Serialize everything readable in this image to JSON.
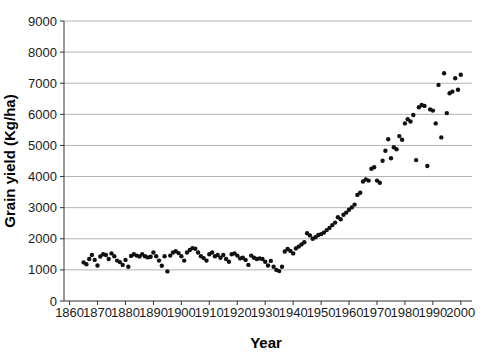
{
  "page": {
    "background": "#ffffff"
  },
  "chart_data": {
    "type": "scatter",
    "title": "",
    "xlabel": "Year",
    "ylabel": "Grain yield (Kg/ha)",
    "xlim": [
      1858,
      2004
    ],
    "ylim": [
      0,
      9000
    ],
    "xticks": [
      1860,
      1870,
      1880,
      1890,
      1900,
      1910,
      1920,
      1930,
      1940,
      1950,
      1960,
      1970,
      1980,
      1990,
      2000
    ],
    "yticks": [
      0,
      1000,
      2000,
      3000,
      4000,
      5000,
      6000,
      7000,
      8000,
      9000
    ],
    "grid": "horizontal",
    "legend": "none",
    "gridline_color": "#b3b3b3",
    "axis_color": "#333333",
    "marker": {
      "shape": "circle",
      "color": "#111111",
      "diameter_px": 4.4
    },
    "series": [
      {
        "name": "Grain yield",
        "points": [
          [
            1865,
            1240
          ],
          [
            1866,
            1180
          ],
          [
            1867,
            1350
          ],
          [
            1868,
            1480
          ],
          [
            1869,
            1320
          ],
          [
            1870,
            1140
          ],
          [
            1871,
            1430
          ],
          [
            1872,
            1500
          ],
          [
            1873,
            1480
          ],
          [
            1874,
            1350
          ],
          [
            1875,
            1530
          ],
          [
            1876,
            1440
          ],
          [
            1877,
            1300
          ],
          [
            1878,
            1250
          ],
          [
            1879,
            1160
          ],
          [
            1880,
            1320
          ],
          [
            1881,
            1100
          ],
          [
            1882,
            1450
          ],
          [
            1883,
            1500
          ],
          [
            1884,
            1460
          ],
          [
            1885,
            1430
          ],
          [
            1886,
            1500
          ],
          [
            1887,
            1440
          ],
          [
            1888,
            1400
          ],
          [
            1889,
            1420
          ],
          [
            1890,
            1560
          ],
          [
            1891,
            1440
          ],
          [
            1892,
            1300
          ],
          [
            1893,
            1130
          ],
          [
            1894,
            1440
          ],
          [
            1895,
            950
          ],
          [
            1896,
            1460
          ],
          [
            1897,
            1560
          ],
          [
            1898,
            1600
          ],
          [
            1899,
            1540
          ],
          [
            1900,
            1440
          ],
          [
            1901,
            1300
          ],
          [
            1902,
            1560
          ],
          [
            1903,
            1640
          ],
          [
            1904,
            1700
          ],
          [
            1905,
            1680
          ],
          [
            1906,
            1560
          ],
          [
            1907,
            1440
          ],
          [
            1908,
            1380
          ],
          [
            1909,
            1300
          ],
          [
            1910,
            1500
          ],
          [
            1911,
            1560
          ],
          [
            1912,
            1440
          ],
          [
            1913,
            1480
          ],
          [
            1914,
            1390
          ],
          [
            1915,
            1480
          ],
          [
            1916,
            1350
          ],
          [
            1917,
            1260
          ],
          [
            1918,
            1500
          ],
          [
            1919,
            1530
          ],
          [
            1920,
            1460
          ],
          [
            1921,
            1370
          ],
          [
            1922,
            1390
          ],
          [
            1923,
            1320
          ],
          [
            1924,
            1160
          ],
          [
            1925,
            1460
          ],
          [
            1926,
            1390
          ],
          [
            1927,
            1350
          ],
          [
            1928,
            1370
          ],
          [
            1929,
            1350
          ],
          [
            1930,
            1260
          ],
          [
            1931,
            1140
          ],
          [
            1932,
            1290
          ],
          [
            1933,
            1100
          ],
          [
            1934,
            1000
          ],
          [
            1935,
            960
          ],
          [
            1936,
            1100
          ],
          [
            1937,
            1590
          ],
          [
            1938,
            1670
          ],
          [
            1939,
            1610
          ],
          [
            1940,
            1530
          ],
          [
            1941,
            1690
          ],
          [
            1942,
            1750
          ],
          [
            1943,
            1820
          ],
          [
            1944,
            1890
          ],
          [
            1945,
            2180
          ],
          [
            1946,
            2110
          ],
          [
            1947,
            2000
          ],
          [
            1948,
            2050
          ],
          [
            1949,
            2120
          ],
          [
            1950,
            2150
          ],
          [
            1951,
            2200
          ],
          [
            1952,
            2280
          ],
          [
            1953,
            2350
          ],
          [
            1954,
            2440
          ],
          [
            1955,
            2520
          ],
          [
            1956,
            2690
          ],
          [
            1957,
            2630
          ],
          [
            1958,
            2770
          ],
          [
            1959,
            2840
          ],
          [
            1960,
            2930
          ],
          [
            1961,
            3010
          ],
          [
            1962,
            3100
          ],
          [
            1963,
            3410
          ],
          [
            1964,
            3480
          ],
          [
            1965,
            3840
          ],
          [
            1966,
            3910
          ],
          [
            1967,
            3870
          ],
          [
            1968,
            4250
          ],
          [
            1969,
            4300
          ],
          [
            1970,
            3870
          ],
          [
            1971,
            3800
          ],
          [
            1972,
            4510
          ],
          [
            1973,
            4830
          ],
          [
            1974,
            5200
          ],
          [
            1975,
            4590
          ],
          [
            1976,
            4940
          ],
          [
            1977,
            4880
          ],
          [
            1978,
            5300
          ],
          [
            1979,
            5180
          ],
          [
            1980,
            5710
          ],
          [
            1981,
            5840
          ],
          [
            1982,
            5770
          ],
          [
            1983,
            5980
          ],
          [
            1984,
            4530
          ],
          [
            1985,
            6230
          ],
          [
            1986,
            6300
          ],
          [
            1987,
            6270
          ],
          [
            1988,
            4340
          ],
          [
            1989,
            6160
          ],
          [
            1990,
            6120
          ],
          [
            1991,
            5710
          ],
          [
            1992,
            6945
          ],
          [
            1993,
            5260
          ],
          [
            1994,
            7320
          ],
          [
            1995,
            6040
          ],
          [
            1996,
            6680
          ],
          [
            1997,
            6730
          ],
          [
            1998,
            7160
          ],
          [
            1999,
            6790
          ],
          [
            2000,
            7270
          ]
        ]
      }
    ],
    "plot_area_px": {
      "left": 64,
      "right": 472,
      "top": 21,
      "bottom": 301
    }
  }
}
